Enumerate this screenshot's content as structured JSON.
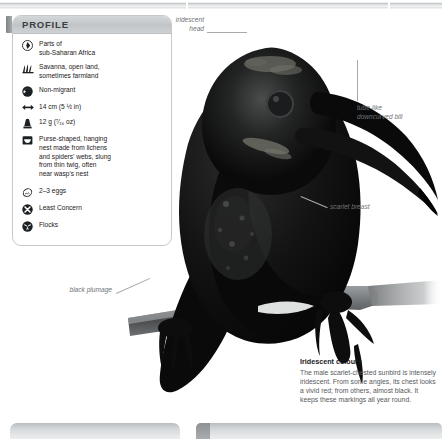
{
  "page": {
    "bird_alt": "scarlet-chested sunbird silhouette perched on a branch"
  },
  "profile": {
    "header_title": "PROFILE",
    "rows": [
      {
        "icon": "globe-range-icon",
        "text": "Parts of\nsub-Saharan Africa"
      },
      {
        "icon": "grassland-habitat-icon",
        "text": "Savanna, open land,\nsometimes farmland"
      },
      {
        "icon": "migration-icon",
        "text": "Non-migrant"
      },
      {
        "icon": "length-arrows-icon",
        "text": "14 cm (5 ½ in)"
      },
      {
        "icon": "weight-icon",
        "text": "12 g (⁷⁄₁₆ oz)"
      },
      {
        "icon": "nest-icon",
        "text": "Purse-shaped, hanging\nnest made from lichens\nand spiders' webs, slung\nfrom thin twig, often\nnear wasp's nest"
      },
      {
        "icon": "egg-icon",
        "text": "2–3 eggs"
      },
      {
        "icon": "conservation-status-icon",
        "text": "Least Concern"
      },
      {
        "icon": "flock-icon",
        "text": "Flocks"
      }
    ]
  },
  "annotations": {
    "head": "iridescent\nhead",
    "bill": "tube-like\ndowncurved bill",
    "breast": "scarlet breast",
    "plumage": "black plumage"
  },
  "caption": {
    "title": "Iridescent colours",
    "body": "The male scarlet-chested sunbird is intensely iridescent. From some angles, its chest looks a vivid red; from others, almost black. It keeps these markings all year round."
  },
  "colors": {
    "panel_border": "#c6c9cb",
    "header_bg": "#c5c8ca",
    "text": "#1d2022",
    "annotation_text": "#6f7376",
    "caption_text": "#56595c",
    "rule": "#c9ccce"
  }
}
